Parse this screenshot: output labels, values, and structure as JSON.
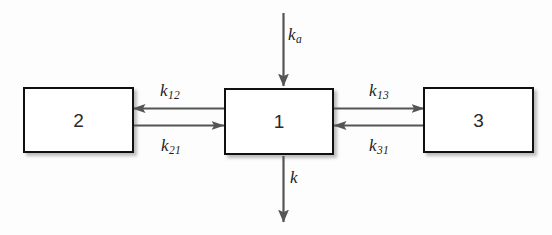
{
  "figure": {
    "background_color": "#fdfdfd",
    "box_border_color": "#101010",
    "arrow_color": "#555555",
    "text_color": "#222222"
  },
  "compartments": [
    {
      "id": "box-2",
      "label": "2",
      "name": "peripheral-compartment-2"
    },
    {
      "id": "box-1",
      "label": "1",
      "name": "central-compartment-1"
    },
    {
      "id": "box-3",
      "label": "3",
      "name": "peripheral-compartment-3"
    }
  ],
  "rates": {
    "absorption": {
      "symbol": "k",
      "subscript": "a",
      "direction": "into-compartment-1"
    },
    "central_to_two": {
      "symbol": "k",
      "subscript": "12",
      "direction": "1-to-2"
    },
    "two_to_central": {
      "symbol": "k",
      "subscript": "21",
      "direction": "2-to-1"
    },
    "central_to_three": {
      "symbol": "k",
      "subscript": "13",
      "direction": "1-to-3"
    },
    "three_to_central": {
      "symbol": "k",
      "subscript": "31",
      "direction": "3-to-1"
    },
    "elimination": {
      "symbol": "k",
      "subscript": "",
      "direction": "out-of-compartment-1"
    }
  }
}
